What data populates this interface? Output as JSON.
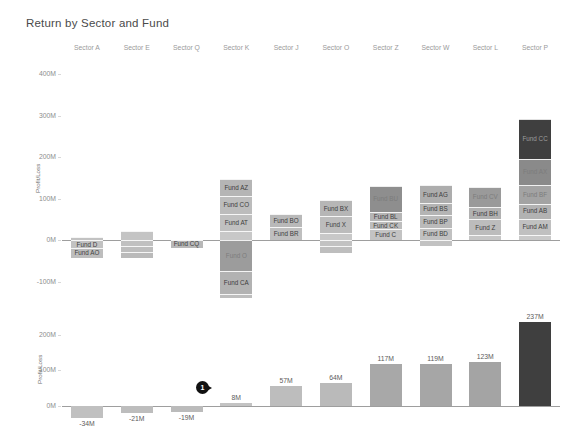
{
  "chart_data": {
    "type": "bar",
    "title": "Return by Sector and Fund",
    "xlabel": "",
    "ylabel": "Profit/Loss",
    "categories": [
      "Sector A",
      "Sector E",
      "Sector Q",
      "Sector K",
      "Sector J",
      "Sector O",
      "Sector Z",
      "Sector W",
      "Sector L",
      "Sector P"
    ],
    "panels": [
      {
        "name": "stacked-fund-breakdown",
        "type": "bar",
        "stacked": true,
        "ylabel": "Profit/Loss",
        "ylim": [
          -130,
          430
        ],
        "yticks": [
          "400M",
          "300M",
          "200M",
          "100M",
          "0M",
          "-100M"
        ],
        "ytick_values": [
          400,
          300,
          200,
          100,
          0,
          -100
        ],
        "grid": false,
        "stacks": [
          {
            "category": "Sector A",
            "total": -34,
            "segments": [
              {
                "fund": "",
                "value": 8,
                "shade": "#c2c2c2",
                "label_visible": false
              },
              {
                "fund": "Fund D",
                "value": -20,
                "shade": "#c2c2c2",
                "label_visible": true
              },
              {
                "fund": "Fund AO",
                "value": -22,
                "shade": "#bdbdbd",
                "label_visible": true
              }
            ]
          },
          {
            "category": "Sector E",
            "total": -21,
            "segments": [
              {
                "fund": "",
                "value": 22,
                "shade": "#c4c4c4",
                "label_visible": false
              },
              {
                "fund": "",
                "value": -14,
                "shade": "#c0c0c0",
                "label_visible": false
              },
              {
                "fund": "",
                "value": -15,
                "shade": "#bdbdbd",
                "label_visible": false
              },
              {
                "fund": "",
                "value": -14,
                "shade": "#bababa",
                "label_visible": false
              }
            ]
          },
          {
            "category": "Sector Q",
            "total": -19,
            "segments": [
              {
                "fund": "Fund CQ",
                "value": -19,
                "shade": "#b8b8b8",
                "label_visible": true
              }
            ]
          },
          {
            "category": "Sector K",
            "total": 8,
            "segments": [
              {
                "fund": "",
                "value": 22,
                "shade": "#c8c8c8",
                "label_visible": false
              },
              {
                "fund": "Fund AT",
                "value": 42,
                "shade": "#c0c0c0",
                "label_visible": true
              },
              {
                "fund": "Fund CO",
                "value": 42,
                "shade": "#bcbcbc",
                "label_visible": true
              },
              {
                "fund": "Fund AZ",
                "value": 42,
                "shade": "#b5b5b5",
                "label_visible": true
              },
              {
                "fund": "Fund O",
                "value": -75,
                "shade": "#9c9c9c",
                "label_visible": true
              },
              {
                "fund": "Fund CA",
                "value": -55,
                "shade": "#b2b2b2",
                "label_visible": true
              },
              {
                "fund": "",
                "value": -10,
                "shade": "#bdbdbd",
                "label_visible": false
              }
            ]
          },
          {
            "category": "Sector J",
            "total": 57,
            "segments": [
              {
                "fund": "Fund BR",
                "value": 32,
                "shade": "#bfbfbf",
                "label_visible": true
              },
              {
                "fund": "Fund BO",
                "value": 30,
                "shade": "#b9b9b9",
                "label_visible": true
              }
            ]
          },
          {
            "category": "Sector O",
            "total": 64,
            "segments": [
              {
                "fund": "",
                "value": 18,
                "shade": "#c8c8c8",
                "label_visible": false
              },
              {
                "fund": "Fund X",
                "value": 40,
                "shade": "#bcbcbc",
                "label_visible": true
              },
              {
                "fund": "Fund BX",
                "value": 38,
                "shade": "#b6b6b6",
                "label_visible": true
              },
              {
                "fund": "",
                "value": -14,
                "shade": "#c2c2c2",
                "label_visible": false
              },
              {
                "fund": "",
                "value": -16,
                "shade": "#bebebe",
                "label_visible": false
              }
            ]
          },
          {
            "category": "Sector Z",
            "total": 117,
            "segments": [
              {
                "fund": "Fund C",
                "value": 26,
                "shade": "#c3c3c3",
                "label_visible": true
              },
              {
                "fund": "Fund CK",
                "value": 20,
                "shade": "#bdbdbd",
                "label_visible": true
              },
              {
                "fund": "Fund BL",
                "value": 22,
                "shade": "#b5b5b5",
                "label_visible": true
              },
              {
                "fund": "Fund BU",
                "value": 62,
                "shade": "#8e8e8e",
                "label_visible": true
              }
            ]
          },
          {
            "category": "Sector W",
            "total": 119,
            "segments": [
              {
                "fund": "Fund BD",
                "value": 30,
                "shade": "#c1c1c1",
                "label_visible": true
              },
              {
                "fund": "Fund BP",
                "value": 30,
                "shade": "#bababa",
                "label_visible": true
              },
              {
                "fund": "Fund BS",
                "value": 30,
                "shade": "#b4b4b4",
                "label_visible": true
              },
              {
                "fund": "Fund AG",
                "value": 42,
                "shade": "#adadad",
                "label_visible": true
              },
              {
                "fund": "",
                "value": -14,
                "shade": "#c2c2c2",
                "label_visible": false
              }
            ]
          },
          {
            "category": "Sector L",
            "total": 123,
            "segments": [
              {
                "fund": "",
                "value": 12,
                "shade": "#c6c6c6",
                "label_visible": false
              },
              {
                "fund": "Fund Z",
                "value": 38,
                "shade": "#bcbcbc",
                "label_visible": true
              },
              {
                "fund": "Fund BH",
                "value": 30,
                "shade": "#b1b1b1",
                "label_visible": true
              },
              {
                "fund": "Fund CV",
                "value": 48,
                "shade": "#9a9a9a",
                "label_visible": true
              }
            ]
          },
          {
            "category": "Sector P",
            "total": 237,
            "segments": [
              {
                "fund": "",
                "value": 12,
                "shade": "#c9c9c9",
                "label_visible": false
              },
              {
                "fund": "Fund AM",
                "value": 40,
                "shade": "#c0c0c0",
                "label_visible": true
              },
              {
                "fund": "Fund AB",
                "value": 36,
                "shade": "#b2b2b2",
                "label_visible": true
              },
              {
                "fund": "Fund BF",
                "value": 46,
                "shade": "#a3a3a3",
                "label_visible": true
              },
              {
                "fund": "Fund AX",
                "value": 62,
                "shade": "#8a8a8a",
                "label_visible": true
              },
              {
                "fund": "Fund CC",
                "value": 96,
                "shade": "#3f3f3f",
                "label_visible": true
              }
            ]
          }
        ]
      },
      {
        "name": "sector-total-bars",
        "type": "bar",
        "stacked": false,
        "ylabel": "Profit/Loss",
        "ylim": [
          -60,
          265
        ],
        "yticks": [
          "200M",
          "100M",
          "0M"
        ],
        "ytick_values": [
          200,
          100,
          0
        ],
        "grid": false,
        "categories": [
          "Sector A",
          "Sector E",
          "Sector Q",
          "Sector K",
          "Sector J",
          "Sector O",
          "Sector Z",
          "Sector W",
          "Sector L",
          "Sector P"
        ],
        "values": [
          -34,
          -21,
          -19,
          8,
          57,
          64,
          117,
          119,
          123,
          237
        ],
        "value_labels": [
          "-34M",
          "-21M",
          "-19M",
          "8M",
          "57M",
          "64M",
          "117M",
          "119M",
          "123M",
          "237M"
        ],
        "bar_colors": [
          "#c0c0c0",
          "#bdbdbd",
          "#bbbbbb",
          "#c3c3c3",
          "#bdbdbd",
          "#bababa",
          "#a8a8a8",
          "#a6a6a6",
          "#a4a4a4",
          "#3f3f3f"
        ]
      }
    ],
    "annotations": [
      {
        "name": "cursor-pointer",
        "label": "1",
        "near_value": "8M",
        "category": "Sector K"
      }
    ]
  }
}
